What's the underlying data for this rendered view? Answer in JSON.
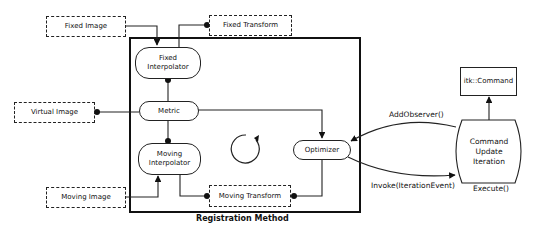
{
  "diagram": {
    "container": {
      "label": "Registration Method"
    },
    "external_inputs": {
      "fixed_image": "Fixed Image",
      "fixed_transform": "Fixed Transform",
      "virtual_image": "Virtual Image",
      "moving_image": "Moving Image",
      "moving_transform": "Moving Transform"
    },
    "components": {
      "fixed_interpolator": {
        "line1": "Fixed",
        "line2": "Interpolator"
      },
      "metric": "Metric",
      "moving_interpolator": {
        "line1": "Moving",
        "line2": "Interpolator"
      },
      "optimizer": "Optimizer"
    },
    "observer": {
      "command_base": "itk::Command",
      "command": {
        "line1": "Command",
        "line2": "Update",
        "line3": "Iteration"
      }
    },
    "edge_labels": {
      "add_observer": "AddObserver()",
      "invoke": "Invoke(IterationEvent)",
      "execute": "Execute()"
    },
    "icons": {
      "cycle": "circular-arrow-icon"
    }
  }
}
